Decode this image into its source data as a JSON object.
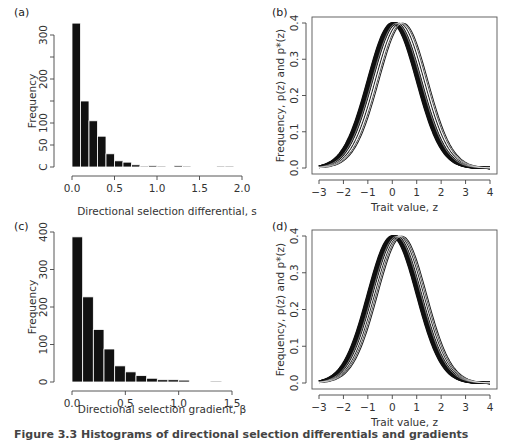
{
  "caption": "Figure 3.3 Histograms of directional selection differentials and gradients",
  "chart_data": [
    {
      "id": "a",
      "panel_label": "(a)",
      "type": "bar",
      "title": "",
      "xlabel": "Directional selection differential, s",
      "ylabel": "Frequency",
      "bin_width": 0.1,
      "bin_start": 0.0,
      "values": [
        327,
        150,
        105,
        70,
        30,
        14,
        11,
        5,
        1,
        3,
        2,
        0,
        3,
        1,
        0,
        0,
        0,
        1,
        1
      ],
      "xlim": [
        0,
        2.0
      ],
      "xticks": [
        "0.0",
        "0.5",
        "1.0",
        "1.5",
        "2.0"
      ],
      "xtick_values": [
        0,
        0.5,
        1.0,
        1.5,
        2.0
      ],
      "ylim": [
        0,
        330
      ],
      "yticks": [
        "C",
        "50",
        "100",
        "200",
        "300"
      ],
      "ytick_values": [
        0,
        50,
        100,
        200,
        300
      ],
      "ytick_minor": [
        150,
        250
      ],
      "grid": false
    },
    {
      "id": "b",
      "panel_label": "(b)",
      "type": "line",
      "title": "",
      "xlabel": "Trait value, z",
      "ylabel": "Frequency, p(z) and p*(z)",
      "description": "Overlaid standard normal density curves with means shifted between 0 and about 0.45",
      "series_means": [
        0.0,
        0.02,
        0.04,
        0.06,
        0.08,
        0.1,
        0.12,
        0.15,
        0.2,
        0.3,
        0.4,
        0.45
      ],
      "sd": 1.0,
      "xlim": [
        -3,
        4
      ],
      "xticks": [
        "-3",
        "-2",
        "-1",
        "0",
        "1",
        "2",
        "3",
        "4"
      ],
      "ylim": [
        0,
        0.4
      ],
      "yticks": [
        "0.0",
        "0.1",
        "0.2",
        "0.3",
        "0.4"
      ],
      "grid": false
    },
    {
      "id": "c",
      "panel_label": "(c)",
      "type": "bar",
      "title": "",
      "xlabel": "Directional selection gradient, β",
      "ylabel": "Frequency",
      "bin_width": 0.1,
      "bin_start": 0.0,
      "values": [
        387,
        227,
        140,
        88,
        43,
        27,
        17,
        10,
        6,
        6,
        5,
        0,
        0,
        1
      ],
      "xlim": [
        0,
        1.5
      ],
      "xticks": [
        "0.0",
        "0.5",
        "1.0",
        "1.5"
      ],
      "xtick_values": [
        0,
        0.5,
        1.0,
        1.5
      ],
      "ylim": [
        0,
        400
      ],
      "yticks": [
        "0",
        "100",
        "200",
        "300",
        "400"
      ],
      "ytick_values": [
        0,
        100,
        200,
        300,
        400
      ],
      "grid": false
    },
    {
      "id": "d",
      "panel_label": "(d)",
      "type": "line",
      "title": "",
      "xlabel": "Trait value, z",
      "ylabel": "Frequency, p(z) and p*(z)",
      "description": "Overlaid standard normal density curves with means shifted between 0 and about 0.4",
      "series_means": [
        0.0,
        0.02,
        0.04,
        0.06,
        0.08,
        0.1,
        0.12,
        0.15,
        0.2,
        0.28,
        0.35,
        0.4
      ],
      "sd": 1.0,
      "xlim": [
        -3,
        4
      ],
      "xticks": [
        "-3",
        "-2",
        "-1",
        "0",
        "1",
        "2",
        "3",
        "4"
      ],
      "ylim": [
        0,
        0.4
      ],
      "yticks": [
        "0.0",
        "0.1",
        "0.2",
        "0.3",
        "0.4"
      ],
      "grid": false
    }
  ],
  "layout": {
    "a": {
      "x0": 72,
      "x1": 242,
      "y0": 167,
      "y1": 35,
      "yPerUnit": 0.44,
      "label_x": 14,
      "label_y": 16,
      "ylabel_x": 36,
      "xlabel_y": 215,
      "axis_x": 54
    },
    "b": {
      "box": [
        312,
        17,
        497,
        174
      ],
      "x0": 319,
      "x1": 490,
      "y0": 168,
      "y1": 23,
      "label_x": 272,
      "label_y": 16
    },
    "c": {
      "x0": 72,
      "x1": 232,
      "y0": 382,
      "y1": 232,
      "yPerUnit": 0.375,
      "label_x": 14,
      "label_y": 230,
      "ylabel_x": 36,
      "xlabel_y": 413,
      "axis_x": 54
    },
    "d": {
      "box": [
        312,
        230,
        497,
        389
      ],
      "x0": 319,
      "x1": 490,
      "y0": 383,
      "y1": 236,
      "label_x": 272,
      "label_y": 230
    }
  }
}
